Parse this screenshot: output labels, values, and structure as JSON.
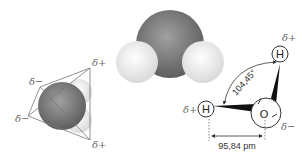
{
  "diagram": {
    "tetrahedral_view": {
      "labels": [
        "δ+",
        "δ−",
        "δ−",
        "δ+"
      ]
    },
    "space_filling_model": {
      "atoms": [
        "O",
        "H",
        "H"
      ]
    },
    "structural_formula": {
      "atom_h_top": "H",
      "atom_h_left": "H",
      "atom_o": "O",
      "charge_h_top": "δ+",
      "charge_h_left": "δ+",
      "charge_o": "δ−",
      "bond_angle": "104,45°",
      "bond_length": "95,84 pm"
    },
    "colors": {
      "oxygen": "#6e6e6e",
      "hydrogen": "#eeeeee",
      "lines": "#555555"
    }
  }
}
